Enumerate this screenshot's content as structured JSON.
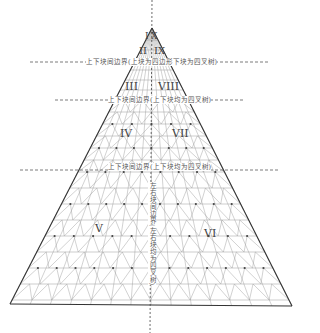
{
  "diagram": {
    "boundary_labels": {
      "top": "上下块间边界(上块为四边形下块为四叉树)",
      "middle": "上下块间边界(上下块均为四叉树)",
      "lower": "上下块间边界(上下块均为四叉树)",
      "vertical": "左右块间边界(左右块均为四叉树)"
    },
    "regions": {
      "I": "I",
      "X": "X",
      "II": "II",
      "IX": "IX",
      "III": "III",
      "VIII": "VIII",
      "IV": "IV",
      "VII": "VII",
      "V": "V",
      "VI": "VI"
    }
  }
}
